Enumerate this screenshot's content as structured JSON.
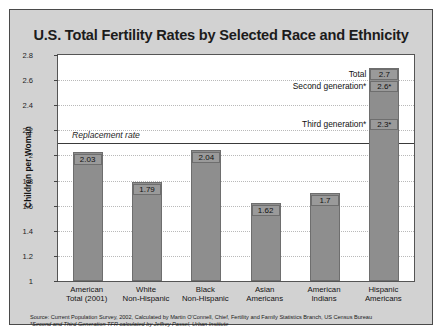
{
  "chart_data": {
    "type": "bar",
    "title": "U.S. Total Fertility Rates by Selected Race and Ethnicity",
    "xlabel": "",
    "ylabel": "Children per Woman",
    "ylim": [
      1,
      2.8
    ],
    "ytick_values": [
      2.8,
      2.6,
      2.4,
      2.2,
      2,
      1.8,
      1.6,
      1.4,
      1.2,
      1
    ],
    "ytick_labels": [
      "2.8",
      "2.6",
      "2.4",
      "2.2",
      "2",
      "1.8",
      "1.6",
      "1.4",
      "1.2",
      "1"
    ],
    "grid": true,
    "legend": "none",
    "categories": [
      "American Total (2001)",
      "White Non-Hispanic",
      "Black Non-Hispanic",
      "Asian Americans",
      "American Indians",
      "Hispanic Americans"
    ],
    "category_lines": [
      [
        "American",
        "Total (2001)"
      ],
      [
        "White",
        "Non-Hispanic"
      ],
      [
        "Black",
        "Non-Hispanic"
      ],
      [
        "Asian",
        "Americans"
      ],
      [
        "American",
        "Indians"
      ],
      [
        "Hispanic",
        "Americans"
      ]
    ],
    "values": [
      2.03,
      1.79,
      2.04,
      1.62,
      1.7,
      2.7
    ],
    "value_labels": [
      "2.03",
      "1.79",
      "2.04",
      "1.62",
      "1.7",
      "2.7"
    ],
    "reference_line": {
      "label": "Replacement rate",
      "value": 2.1
    },
    "annotations": [
      {
        "label": "Total",
        "value": 2.7,
        "value_label": "2.7"
      },
      {
        "label": "Second generation*",
        "value": 2.6,
        "value_label": "2.6*"
      },
      {
        "label": "Third generation*",
        "value": 2.3,
        "value_label": "2.3*"
      }
    ],
    "source_note": "Source: Current Population Survey, 2002, Calculated by Martin O'Connell, Chief, Fertility and Family Statistics Branch, US Census Bureau",
    "footnote": "*Second and Third Generation TFR calculated by Jeffrey Passel, Urban Institute"
  },
  "colors": {
    "bar_fill": "#8e8e8e",
    "panel_background": "#d2d2d2",
    "plot_background": "#ffffff",
    "text": "#1c1c1c"
  }
}
